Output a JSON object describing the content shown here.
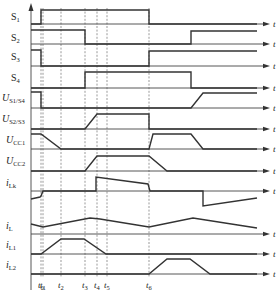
{
  "diagram": {
    "type": "timing-diagram",
    "axis_label": "t",
    "time_markers": [
      {
        "name": "t0",
        "label": "t",
        "sub": "0",
        "x": 41
      },
      {
        "name": "t1",
        "label": "t",
        "sub": "1",
        "x": 43
      },
      {
        "name": "t2",
        "label": "t",
        "sub": "2",
        "x": 61
      },
      {
        "name": "t3",
        "label": "t",
        "sub": "3",
        "x": 85
      },
      {
        "name": "t4",
        "label": "t",
        "sub": "4",
        "x": 97
      },
      {
        "name": "t5",
        "label": "t",
        "sub": "5",
        "x": 107
      },
      {
        "name": "t6",
        "label": "t",
        "sub": "6",
        "x": 149
      }
    ],
    "signals": [
      {
        "name": "S1",
        "main": "S",
        "sub": "1",
        "italic": false,
        "label_y": 20,
        "baseline": 24,
        "points": [
          [
            31,
            24
          ],
          [
            41,
            24
          ],
          [
            41,
            10
          ],
          [
            149,
            10
          ],
          [
            149,
            24
          ],
          [
            257,
            24
          ]
        ]
      },
      {
        "name": "S2",
        "main": "S",
        "sub": "2",
        "italic": false,
        "label_y": 41,
        "baseline": 44,
        "points": [
          [
            31,
            30
          ],
          [
            85,
            30
          ],
          [
            85,
            44
          ],
          [
            191,
            44
          ],
          [
            191,
            31
          ],
          [
            257,
            31
          ]
        ]
      },
      {
        "name": "S3",
        "main": "S",
        "sub": "3",
        "italic": false,
        "label_y": 60,
        "baseline": 66,
        "points": [
          [
            31,
            50
          ],
          [
            41,
            50
          ],
          [
            41,
            66
          ],
          [
            149,
            66
          ],
          [
            149,
            51
          ],
          [
            257,
            51
          ]
        ]
      },
      {
        "name": "S4",
        "main": "S",
        "sub": "4",
        "italic": false,
        "label_y": 81,
        "baseline": 88,
        "points": [
          [
            31,
            88
          ],
          [
            85,
            88
          ],
          [
            85,
            72
          ],
          [
            191,
            72
          ],
          [
            191,
            88
          ],
          [
            257,
            88
          ]
        ]
      },
      {
        "name": "US1S4",
        "main": "U",
        "sub": "S1/S4",
        "italic": true,
        "label_y": 101,
        "baseline": 108,
        "points": [
          [
            31,
            92
          ],
          [
            41,
            92
          ],
          [
            41,
            108
          ],
          [
            191,
            108
          ],
          [
            203,
            93
          ],
          [
            257,
            93
          ]
        ]
      },
      {
        "name": "US2S3",
        "main": "U",
        "sub": "S2/S3",
        "italic": true,
        "label_y": 122,
        "baseline": 129,
        "points": [
          [
            31,
            129
          ],
          [
            85,
            129
          ],
          [
            97,
            114
          ],
          [
            149,
            114
          ],
          [
            149,
            129
          ],
          [
            257,
            129
          ]
        ]
      },
      {
        "name": "UCC1",
        "main": "U",
        "sub": "CC1",
        "italic": true,
        "label_y": 143,
        "baseline": 149,
        "points": [
          [
            31,
            134
          ],
          [
            41,
            134
          ],
          [
            61,
            149
          ],
          [
            149,
            149
          ],
          [
            153,
            134
          ],
          [
            191,
            134
          ],
          [
            203,
            149
          ],
          [
            257,
            149
          ]
        ]
      },
      {
        "name": "UCC2",
        "main": "U",
        "sub": "CC2",
        "italic": true,
        "label_y": 164,
        "baseline": 171,
        "points": [
          [
            31,
            171
          ],
          [
            85,
            171
          ],
          [
            97,
            156
          ],
          [
            149,
            156
          ],
          [
            167,
            171
          ],
          [
            257,
            171
          ]
        ]
      },
      {
        "name": "iLk",
        "main": "i",
        "sub": "Lk",
        "italic": true,
        "label_y": 186,
        "baseline": 191,
        "points": [
          [
            31,
            199
          ],
          [
            40,
            197
          ],
          [
            41,
            196
          ],
          [
            43,
            191
          ],
          [
            96,
            191
          ],
          [
            96,
            177
          ],
          [
            148,
            184
          ],
          [
            150,
            191
          ],
          [
            203,
            191
          ],
          [
            203,
            206
          ],
          [
            257,
            198
          ]
        ]
      },
      {
        "name": "iL",
        "main": "i",
        "sub": "L",
        "italic": true,
        "label_y": 229,
        "baseline": 234,
        "points": [
          [
            31,
            224
          ],
          [
            43,
            227
          ],
          [
            90,
            218
          ],
          [
            100,
            219
          ],
          [
            149,
            227
          ],
          [
            193,
            218
          ],
          [
            257,
            228
          ]
        ]
      },
      {
        "name": "iL1",
        "main": "i",
        "sub": "L1",
        "italic": true,
        "label_y": 248,
        "baseline": 254,
        "points": [
          [
            31,
            254
          ],
          [
            41,
            254
          ],
          [
            61,
            239
          ],
          [
            84,
            239
          ],
          [
            106,
            254
          ],
          [
            257,
            254
          ]
        ]
      },
      {
        "name": "iL2",
        "main": "i",
        "sub": "L2",
        "italic": true,
        "label_y": 268,
        "baseline": 274,
        "points": [
          [
            31,
            274
          ],
          [
            149,
            274
          ],
          [
            167,
            259
          ],
          [
            190,
            259
          ],
          [
            210,
            274
          ],
          [
            257,
            274
          ]
        ]
      }
    ]
  }
}
